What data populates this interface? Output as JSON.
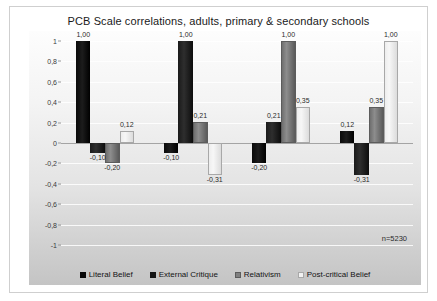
{
  "chart_data": {
    "type": "bar",
    "title": "PCB Scale correlations, adults, primary & secondary schools",
    "xlabel": "",
    "ylabel": "",
    "ylim": [
      -1,
      1
    ],
    "ytick_labels": [
      "1",
      "0,8",
      "0,6",
      "0,4",
      "0,2",
      "0",
      "-0,2",
      "-0,4",
      "-0,6",
      "-0,8",
      "-1"
    ],
    "ytick_values": [
      1,
      0.8,
      0.6,
      0.4,
      0.2,
      0,
      -0.2,
      -0.4,
      -0.6,
      -0.8,
      -1
    ],
    "grid": true,
    "legend_position": "bottom",
    "annotation": "n=5230",
    "categories": [
      "Literal Belief",
      "External Critique",
      "Relativism",
      "Post-critical Belief"
    ],
    "series": [
      {
        "name": "Literal Belief",
        "color": "#080808",
        "values": [
          1.0,
          -0.1,
          -0.2,
          0.12
        ],
        "labels": [
          "1,00",
          "-0,10",
          "-0,20",
          "0,12"
        ]
      },
      {
        "name": "External Critique",
        "color": "#151515",
        "values": [
          -0.1,
          1.0,
          0.21,
          -0.31
        ],
        "labels": [
          "-0,10",
          "1,00",
          "0,21",
          "-0,31"
        ]
      },
      {
        "name": "Relativism",
        "color": "#808080",
        "values": [
          -0.2,
          0.21,
          1.0,
          0.35
        ],
        "labels": [
          "-0,20",
          "0,21",
          "1,00",
          "0,35"
        ]
      },
      {
        "name": "Post-critical Belief",
        "color": "#f2f2f2",
        "values": [
          0.12,
          -0.31,
          0.35,
          1.0
        ],
        "labels": [
          "0,12",
          "-0,31",
          "0,35",
          "1,00"
        ]
      }
    ]
  }
}
